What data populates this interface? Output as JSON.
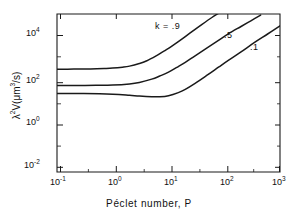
{
  "chart_data": {
    "type": "line",
    "title": "",
    "xlabel": "Péclet number, P",
    "ylabel": "λ²V(μm³/s)",
    "xscale": "log",
    "yscale": "log",
    "xlim": [
      0.1,
      1000
    ],
    "ylim": [
      0.01,
      100000
    ],
    "grid": false,
    "legend_position": "inline-curve-labels",
    "xticks": [
      "10⁻¹",
      "10⁰",
      "10¹",
      "10²",
      "10³"
    ],
    "xtick_values": [
      0.1,
      1,
      10,
      100,
      1000
    ],
    "yticks": [
      "10⁻²",
      "10⁰",
      "10²",
      "10⁴"
    ],
    "ytick_values": [
      0.01,
      1,
      100,
      10000
    ],
    "series": [
      {
        "name": "k = .9",
        "label": "k = .9",
        "x": [
          0.1,
          0.2,
          0.4,
          0.7,
          1.0,
          1.5,
          2.0,
          3.0,
          4.0,
          6.0,
          8.0,
          10.0,
          15.0,
          20.0,
          30.0,
          40.0,
          60.0,
          80.0
        ],
        "y": [
          360,
          362,
          370,
          385,
          400,
          440,
          490,
          640,
          830,
          1400,
          2150,
          3000,
          6000,
          10000,
          21000,
          35000,
          70000,
          110000
        ]
      },
      {
        "name": "k = .5",
        "label": ".5",
        "x": [
          0.1,
          0.2,
          0.5,
          1.0,
          2.0,
          3.0,
          5.0,
          7.0,
          10.0,
          15.0,
          20.0,
          30.0,
          50.0,
          80.0,
          120.0,
          200.0,
          300.0,
          450.0
        ],
        "y": [
          68,
          68,
          69,
          71,
          80,
          93,
          130,
          180,
          265,
          470,
          720,
          1400,
          3200,
          7000,
          13500,
          28000,
          50000,
          90000
        ]
      },
      {
        "name": "k = .1",
        "label": ".1",
        "x": [
          0.1,
          0.3,
          1.0,
          2.0,
          3.0,
          5.0,
          7.0,
          10.0,
          15.0,
          20.0,
          30.0,
          50.0,
          80.0,
          120.0,
          200.0,
          350.0,
          600.0,
          1000.0
        ],
        "y": [
          30,
          30,
          28,
          25,
          23,
          21.5,
          21.5,
          24,
          33,
          46,
          85,
          200,
          450,
          900,
          2100,
          5500,
          13000,
          30000
        ]
      }
    ],
    "annotations": [
      {
        "text": "k = .9",
        "x_px": 171,
        "y_px": 27
      },
      {
        "text": ".5",
        "x_px": 229,
        "y_px": 36
      },
      {
        "text": ".1",
        "x_px": 254,
        "y_px": 47
      }
    ]
  },
  "axes": {
    "x_title": "Péclet number, P",
    "y_title_main": "λ",
    "y_title_sup1": "2",
    "y_title_rest": "V(μm",
    "y_title_sup2": "3",
    "y_title_tail": "/s)",
    "x_tick_labels": [
      {
        "mantissa": "10",
        "exp": "-1"
      },
      {
        "mantissa": "10",
        "exp": "0"
      },
      {
        "mantissa": "10",
        "exp": "1"
      },
      {
        "mantissa": "10",
        "exp": "2"
      },
      {
        "mantissa": "10",
        "exp": "3"
      }
    ],
    "y_tick_labels": [
      {
        "mantissa": "10",
        "exp": "4"
      },
      {
        "mantissa": "10",
        "exp": "2"
      },
      {
        "mantissa": "10",
        "exp": "0"
      },
      {
        "mantissa": "10",
        "exp": "-2"
      }
    ]
  },
  "style": {
    "axis_color": "#1a1a1a",
    "curve_color": "#1a1a1a",
    "background": "#ffffff"
  }
}
